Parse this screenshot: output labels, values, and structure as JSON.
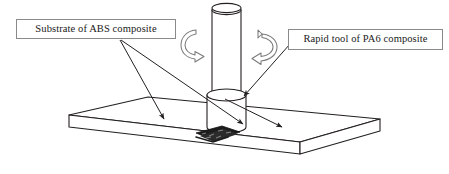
{
  "figure": {
    "background_color": "#ffffff",
    "line_color": "#231f20",
    "weld_color": "#1a1a1a",
    "arrow_color": "#6f6f6f",
    "box_border_color": "#8a8a8a"
  },
  "callouts": {
    "substrate": {
      "label": "Substrate of ABS composite",
      "material": "ABS composite"
    },
    "tool": {
      "label": "Rapid tool of PA6 composite",
      "material": "PA6 composite"
    }
  },
  "parts": {
    "plate_name": "substrate-plate",
    "tool_shank_name": "tool-shank",
    "tool_shoulder_name": "tool-shoulder",
    "weld_zone_name": "weld-nugget",
    "rotation_left_name": "rotation-arrow-left",
    "rotation_right_name": "rotation-arrow-right"
  }
}
